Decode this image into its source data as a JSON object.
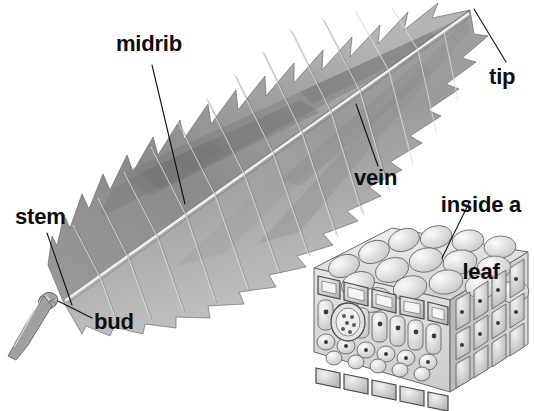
{
  "figure": {
    "subject": "leaf",
    "style": "grayscale pencil illustration",
    "background_color": "#ffffff",
    "label_color": "#0d0d0d",
    "width": 534,
    "height": 411
  },
  "labels": {
    "midrib": "midrib",
    "tip": "tip",
    "vein": "vein",
    "stem": "stem",
    "bud": "bud",
    "inside_a_leaf_line1": "inside a",
    "inside_a_leaf_line2": "leaf"
  },
  "parts": [
    {
      "name": "midrib",
      "label": "midrib",
      "leader_from": [
        152,
        65
      ],
      "leader_to": [
        185,
        204
      ]
    },
    {
      "name": "tip",
      "label": "tip",
      "leader_from": [
        506,
        62
      ],
      "leader_to": [
        474,
        9
      ]
    },
    {
      "name": "vein",
      "label": "vein",
      "leader_from": [
        378,
        166
      ],
      "leader_to": [
        356,
        104
      ]
    },
    {
      "name": "stem",
      "label": "stem",
      "leader_from": [
        47,
        233
      ],
      "leader_to": [
        72,
        305
      ]
    },
    {
      "name": "bud",
      "label": "bud",
      "leader_from": [
        92,
        318
      ],
      "leader_to": [
        63,
        303
      ]
    },
    {
      "name": "inside-a-leaf",
      "label": "inside a leaf",
      "leader_from": [
        470,
        201
      ],
      "leader_to": [
        442,
        258
      ]
    }
  ],
  "leaf": {
    "shape": "elliptic, serrate margin, pinnate venation",
    "orientation": "base lower-left, tip upper-right",
    "tip_point": [
      474,
      8
    ],
    "base_point": [
      63,
      303
    ],
    "midrib_from": [
      66,
      300
    ],
    "midrib_to": [
      468,
      14
    ],
    "tone_light": "#d8d8d8",
    "tone_mid": "#8d8d8d",
    "tone_dark": "#5a5a5a"
  },
  "cell_block": {
    "name": "inside a leaf",
    "description": "three-dimensional cut block of leaf tissue",
    "bounds": [
      304,
      228,
      230,
      183
    ],
    "layers": [
      {
        "name": "upper-epidermis",
        "description": "rounded surface cells on top face"
      },
      {
        "name": "palisade-layer",
        "description": "tall column cells below upper epidermis"
      },
      {
        "name": "spongy-layer",
        "description": "loosely packed rounded cells"
      },
      {
        "name": "lower-epidermis",
        "description": "flat boxed cells on bottom edge"
      },
      {
        "name": "vascular-bundle",
        "description": "circular vein bundle on left cut face"
      }
    ]
  }
}
